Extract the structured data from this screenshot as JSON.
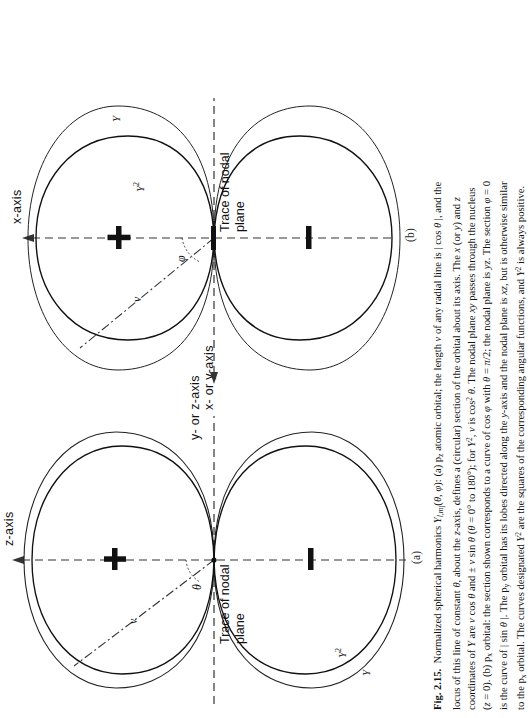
{
  "figure": {
    "number": "Fig. 2.15.",
    "panels": [
      {
        "id": "a",
        "label": "(a)",
        "vertical_axis_label": "z-axis",
        "horizontal_axis_label": "x- or y-axis",
        "nodal_label_line1": "Trace of nodal",
        "nodal_label_line2": "plane",
        "positive_sign": "+",
        "negative_sign": "–",
        "angle_symbol": "θ",
        "radius_symbol": "v",
        "curve_label_outer": "Y",
        "curve_label_inner": "Y2",
        "curve_label_inner_base": "Y",
        "curve_label_inner_exp": "2"
      },
      {
        "id": "b",
        "label": "(b)",
        "vertical_axis_label": "x-axis",
        "horizontal_axis_label": "y- or z-axis",
        "nodal_label_line1": "Trace of nodal",
        "nodal_label_line2": "plane",
        "positive_sign": "+",
        "negative_sign": "–",
        "angle_symbol": "φ",
        "radius_symbol": "v",
        "curve_label_outer": "Y",
        "curve_label_inner_base": "Y",
        "curve_label_inner_exp": "2"
      }
    ]
  },
  "caption": {
    "number": "Fig. 2.15.",
    "lines": [
      "Normalized spherical harmonics Y_{l,m_l}(θ, φ): (a) p_z atomic orbital; the length v of any radial line is | cos θ |, and the",
      "locus of this line of constant θ, about the z-axis, defines a (circular) section of the orbital about its axis. The x (or y) and z",
      "coordinates of Y are v cos θ and ± v sin θ (θ = 0° to 180°); for Y², v is cos² θ. The nodal plane xy passes through the nucleus",
      "(z = 0). (b) p_x orbital: the section shown corresponds to a curve of cos φ with θ = π/2; the nodal plane is yz. The section φ = 0",
      "is the curve of | sin θ |. The p_y orbital has its lobes directed along the y-axis and the nodal plane is xz, but is otherwise similar",
      "to the p_x orbital. The curves designated Y² are the squares of the corresponding angular functions, and Y² is always positive."
    ],
    "full_text": "Fig. 2.15. Normalized spherical harmonics Y_{l,m_l}(θ, φ): (a) p_z atomic orbital; the length v of any radial line is | cos θ |, and the locus of this line of constant θ, about the z-axis, defines a (circular) section of the orbital about its axis. The x (or y) and z coordinates of Y are v cos θ and ± v sin θ (θ = 0° to 180°); for Y², v is cos² θ. The nodal plane xy passes through the nucleus (z = 0). (b) p_x orbital: the section shown corresponds to a curve of cos φ with θ = π/2; the nodal plane is yz. The section φ = 0 is the curve of | sin θ |. The p_y orbital has its lobes directed along the y-axis and the nodal plane is xz, but is otherwise similar to the p_x orbital. The curves designated Y² are the squares of the corresponding angular functions, and Y² is always positive."
  },
  "colors": {
    "ink": "#141414",
    "paper": "#ffffff",
    "rule": "#333333"
  }
}
